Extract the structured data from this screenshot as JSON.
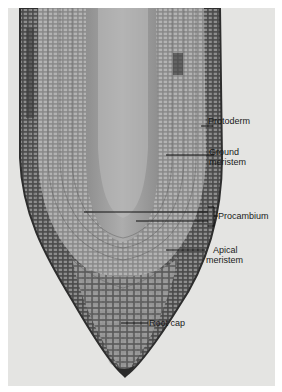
{
  "figure": {
    "labels": {
      "protoderm": "Protoderm",
      "ground_meristem_1": "Ground",
      "ground_meristem_2": "meristem",
      "procambium": "Procambium",
      "apical_meristem_1": "Apical",
      "apical_meristem_2": "meristem",
      "root_cap": "Root cap"
    },
    "colors": {
      "background": "#e4e4e2",
      "tissue_dark": "#3a3a3a",
      "tissue_mid": "#7a7a7a",
      "tissue_light": "#b8b8b8"
    }
  }
}
